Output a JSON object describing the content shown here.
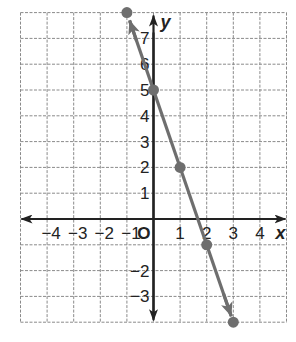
{
  "chart_data": {
    "type": "line",
    "title": "",
    "xlabel": "x",
    "ylabel": "y",
    "xlim": [
      -5,
      5
    ],
    "ylim": [
      -4,
      8
    ],
    "grid": true,
    "origin_label": "O",
    "x_ticks": [
      "−4",
      "−3",
      "−2",
      "−1",
      "1",
      "2",
      "3",
      "4"
    ],
    "x_tick_values": [
      -4,
      -3,
      -2,
      -1,
      1,
      2,
      3,
      4
    ],
    "y_ticks": [
      "7",
      "6",
      "5",
      "4",
      "3",
      "2",
      "1",
      "−2",
      "−3"
    ],
    "y_tick_values": [
      7,
      6,
      5,
      4,
      3,
      2,
      1,
      -2,
      -3
    ],
    "series": [
      {
        "name": "line",
        "equation": "y = -3x + 5",
        "color": "#6e6e6e",
        "x": [
          -1,
          0,
          1,
          2,
          3
        ],
        "y": [
          8,
          5,
          2,
          -1,
          -4
        ]
      }
    ]
  }
}
